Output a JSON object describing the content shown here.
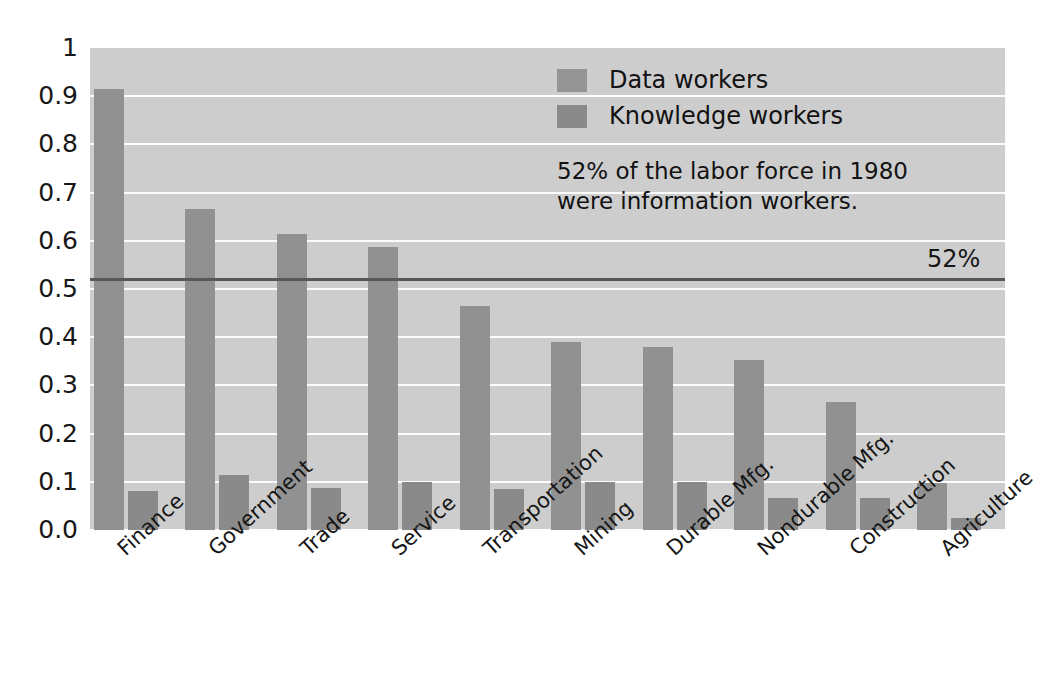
{
  "chart_data": {
    "type": "bar",
    "title": "",
    "xlabel": "",
    "ylabel": "",
    "ylim": [
      0,
      1
    ],
    "grid": true,
    "legend_position": "inside-top-center",
    "categories": [
      "Finance",
      "Government",
      "Trade",
      "Service",
      "Transportation",
      "Mining",
      "Durable Mfg.",
      "Nondurable Mfg.",
      "Construction",
      "Agriculture"
    ],
    "series": [
      {
        "name": "Data workers",
        "color": "#919191",
        "values": [
          0.915,
          0.665,
          0.615,
          0.588,
          0.465,
          0.39,
          0.38,
          0.352,
          0.265,
          0.098
        ]
      },
      {
        "name": "Knowledge workers",
        "color": "#8a8a8a",
        "values": [
          0.08,
          0.115,
          0.088,
          0.1,
          0.086,
          0.1,
          0.1,
          0.066,
          0.066,
          0.025
        ]
      }
    ],
    "ytick_labels": [
      "1",
      "0.9",
      "0.8",
      "0.7",
      "0.6",
      "0.5",
      "0.4",
      "0.3",
      "0.2",
      "0.1",
      "0.0"
    ],
    "ytick_values": [
      1,
      0.9,
      0.8,
      0.7,
      0.6,
      0.5,
      0.4,
      0.3,
      0.2,
      0.1,
      0.0
    ],
    "reference_line": {
      "value": 0.52,
      "label": "52%",
      "color": "#58585a"
    },
    "annotation": "52% of the labor force in 1980\nwere information workers.",
    "background_color": "#cdcdcd",
    "gridline_color": "#fdfdfd"
  }
}
